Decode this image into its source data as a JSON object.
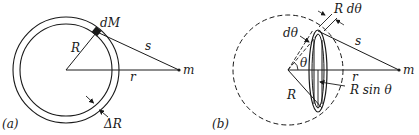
{
  "figure": {
    "panel_a": {
      "label": "(a)",
      "element_label": "dM",
      "radius_label": "R",
      "distance_s_label": "s",
      "distance_r_label": "r",
      "mass_label": "m",
      "thickness_label": "ΔR"
    },
    "panel_b": {
      "label": "(b)",
      "arc_width_label": "R dθ",
      "dtheta_label": "dθ",
      "theta_label": "θ",
      "radius_label": "R",
      "ring_radius_label": "R sin θ",
      "distance_s_label": "s",
      "distance_r_label": "r",
      "mass_label": "m"
    }
  }
}
